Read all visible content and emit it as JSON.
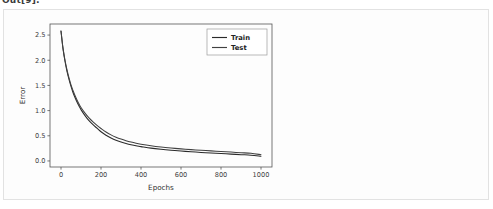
{
  "notebook": {
    "out_label": "Out[9]:"
  },
  "card": {
    "background": "#fdfdfd",
    "border_color": "#e2e2e2"
  },
  "chart_data": {
    "type": "line",
    "title": "",
    "xlabel": "Epochs",
    "ylabel": "Error",
    "xlim": [
      -55,
      1055
    ],
    "ylim": [
      -0.12,
      2.72
    ],
    "xticks": [
      0,
      200,
      400,
      600,
      800,
      1000
    ],
    "xticklabels": [
      "0",
      "200",
      "400",
      "600",
      "800",
      "1000"
    ],
    "yticks": [
      0.0,
      0.5,
      1.0,
      1.5,
      2.0,
      2.5
    ],
    "yticklabels": [
      "0.0",
      "0.5",
      "1.0",
      "1.5",
      "2.0",
      "2.5"
    ],
    "grid": false,
    "legend_position": "upper right",
    "legend_entries": [
      "Train",
      "Test"
    ],
    "x": [
      0,
      10,
      20,
      30,
      40,
      50,
      60,
      70,
      80,
      90,
      100,
      120,
      140,
      160,
      180,
      200,
      225,
      250,
      275,
      300,
      325,
      350,
      375,
      400,
      450,
      500,
      550,
      600,
      650,
      700,
      750,
      800,
      850,
      900,
      950,
      1000
    ],
    "series": [
      {
        "name": "Train",
        "color": "#2a2a2a",
        "values": [
          2.58,
          2.23,
          1.98,
          1.78,
          1.62,
          1.48,
          1.36,
          1.26,
          1.17,
          1.09,
          1.02,
          0.9,
          0.8,
          0.72,
          0.65,
          0.58,
          0.51,
          0.455,
          0.41,
          0.375,
          0.345,
          0.32,
          0.3,
          0.285,
          0.255,
          0.232,
          0.213,
          0.197,
          0.183,
          0.17,
          0.158,
          0.147,
          0.136,
          0.125,
          0.115,
          0.094
        ]
      },
      {
        "name": "Test",
        "color": "#414141",
        "values": [
          2.58,
          2.24,
          2.0,
          1.81,
          1.65,
          1.51,
          1.4,
          1.3,
          1.21,
          1.13,
          1.06,
          0.95,
          0.855,
          0.775,
          0.705,
          0.645,
          0.575,
          0.518,
          0.472,
          0.434,
          0.402,
          0.375,
          0.352,
          0.333,
          0.302,
          0.277,
          0.257,
          0.24,
          0.225,
          0.212,
          0.2,
          0.188,
          0.176,
          0.164,
          0.152,
          0.124
        ]
      }
    ]
  }
}
